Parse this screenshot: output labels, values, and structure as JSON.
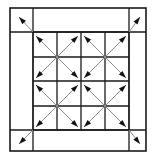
{
  "figure": {
    "background_color": "#ffffff",
    "line_color": "#1a1a1a",
    "arrow_shaft_color": "#8c8c8c",
    "arrow_head_color": "#111111",
    "canvas": {
      "width": 156,
      "height": 162
    }
  },
  "outer_frame": {
    "name": "outer-border-rectangle",
    "x": 10,
    "y": 8,
    "width": 136,
    "height": 143,
    "stroke_width": 1.6
  },
  "inner_grid": {
    "name": "inner-4x4-grid",
    "x": 33,
    "y": 32,
    "width": 96,
    "height": 98,
    "columns": 4,
    "rows": 4,
    "stroke_width": 1.3,
    "x_lines": [
      33,
      57,
      81,
      105,
      129
    ],
    "y_lines": [
      32,
      57,
      81,
      106,
      130
    ]
  },
  "border_strip_lines": {
    "name": "border-strip-separators",
    "vertical_x": [
      33,
      129
    ],
    "horizontal_y": [
      32,
      130
    ]
  },
  "cross_blocks": [
    {
      "name": "cross-block-top-left",
      "cx": 57,
      "cy": 57,
      "half": 21
    },
    {
      "name": "cross-block-top-right",
      "cx": 105,
      "cy": 57,
      "half": 21
    },
    {
      "name": "cross-block-bottom-left",
      "cx": 57,
      "cy": 106,
      "half": 21
    },
    {
      "name": "cross-block-bottom-right",
      "cx": 105,
      "cy": 106,
      "half": 21
    }
  ],
  "corner_arrows": [
    {
      "name": "corner-arrow-top-left",
      "x1": 33,
      "y1": 32,
      "x2": 19,
      "y2": 17
    },
    {
      "name": "corner-arrow-top-right",
      "x1": 129,
      "y1": 32,
      "x2": 140,
      "y2": 17
    },
    {
      "name": "corner-arrow-bottom-left",
      "x1": 33,
      "y1": 130,
      "x2": 19,
      "y2": 144
    },
    {
      "name": "corner-arrow-bottom-right",
      "x1": 129,
      "y1": 130,
      "x2": 140,
      "y2": 144
    }
  ],
  "arrow_head": {
    "length": 7.5,
    "width": 5.0
  },
  "labels": {
    "figure_caption": ""
  }
}
